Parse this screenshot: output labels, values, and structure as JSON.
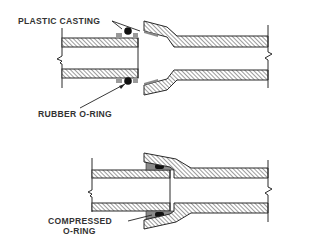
{
  "diagram": {
    "title": "",
    "colors": {
      "outline": "#2a2a2a",
      "hatch": "#5a5a5a",
      "casting": "#9a9a9a",
      "oring": "#111111",
      "background": "#ffffff",
      "text": "#333333"
    },
    "top_view": {
      "description": "Uncoupled pipe joint",
      "labels": {
        "plastic_casting": "PLASTIC CASTING",
        "rubber_oring": "RUBBER O-RING"
      }
    },
    "bottom_view": {
      "description": "Coupled pipe joint",
      "labels": {
        "compressed_line1": "COMPRESSED",
        "compressed_line2": "O-RING"
      }
    }
  }
}
